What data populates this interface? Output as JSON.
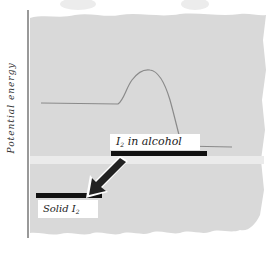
{
  "diagram": {
    "type": "potential-energy-diagram",
    "y_axis_label": "Potential energy",
    "levels": [
      {
        "id": "i2-alcohol",
        "label": "I",
        "subscript": "2",
        "suffix": " in alcohol"
      },
      {
        "id": "solid-i2",
        "label": "Solid I",
        "subscript": "2"
      }
    ],
    "arrow": {
      "from": "I2 in alcohol",
      "to": "Solid I2",
      "direction": "down-left"
    },
    "curve": {
      "description": "flat, rises to activation peak, drops to lower level"
    },
    "colors": {
      "paper": "#d9d9d9",
      "curve": "#8a8a8a",
      "bar": "#111111",
      "axis": "#555555",
      "label_bg": "#ffffff"
    }
  }
}
